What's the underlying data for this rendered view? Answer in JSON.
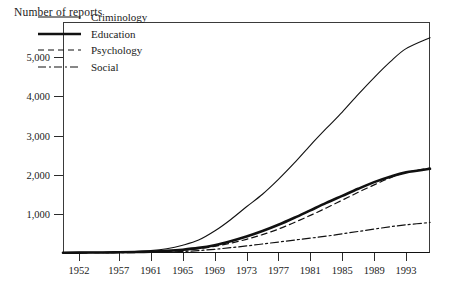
{
  "chart_data": {
    "type": "line",
    "title": "Number of reports",
    "ylabel": "Number of reports",
    "xlabel": "",
    "grid": false,
    "legend_position": "top-left-inside",
    "xlim": [
      1950,
      1996
    ],
    "ylim": [
      0,
      5900
    ],
    "ytick_labels": [
      "1,000",
      "2,000",
      "3,000",
      "4,000",
      "5,000"
    ],
    "ytick_values": [
      1000,
      2000,
      3000,
      4000,
      5000
    ],
    "xtick_labels": [
      "1952",
      "1957",
      "1961",
      "1965",
      "1969",
      "1973",
      "1977",
      "1981",
      "1985",
      "1989",
      "1993"
    ],
    "xtick_values": [
      1952,
      1957,
      1961,
      1965,
      1969,
      1973,
      1977,
      1981,
      1985,
      1989,
      1993
    ],
    "x": [
      1950,
      1952,
      1955,
      1957,
      1959,
      1961,
      1963,
      1965,
      1967,
      1969,
      1971,
      1973,
      1975,
      1977,
      1979,
      1981,
      1983,
      1985,
      1987,
      1989,
      1991,
      1993,
      1996
    ],
    "series": [
      {
        "name": "Criminology",
        "style": "solid-thin",
        "values": [
          10,
          15,
          20,
          28,
          40,
          60,
          110,
          200,
          330,
          560,
          850,
          1180,
          1500,
          1880,
          2300,
          2750,
          3180,
          3600,
          4050,
          4480,
          4880,
          5220,
          5500
        ]
      },
      {
        "name": "Education",
        "style": "solid-thick",
        "values": [
          8,
          10,
          14,
          18,
          24,
          35,
          55,
          85,
          130,
          200,
          300,
          420,
          560,
          720,
          900,
          1090,
          1280,
          1460,
          1640,
          1810,
          1950,
          2060,
          2150
        ]
      },
      {
        "name": "Psychology",
        "style": "dashed",
        "values": [
          6,
          8,
          11,
          14,
          19,
          28,
          44,
          70,
          110,
          170,
          250,
          350,
          470,
          610,
          780,
          960,
          1150,
          1350,
          1550,
          1740,
          1920,
          2060,
          2170
        ]
      },
      {
        "name": "Social",
        "style": "dash-dot",
        "values": [
          4,
          5,
          7,
          9,
          12,
          17,
          25,
          40,
          62,
          95,
          135,
          180,
          230,
          280,
          330,
          380,
          430,
          490,
          550,
          610,
          670,
          720,
          780
        ]
      }
    ]
  },
  "legend": {
    "items": [
      {
        "label": "Criminology",
        "style": "solid-thin"
      },
      {
        "label": "Education",
        "style": "solid-thick"
      },
      {
        "label": "Psychology",
        "style": "dashed"
      },
      {
        "label": "Social",
        "style": "dash-dot"
      }
    ]
  },
  "colors": {
    "line": "#111111",
    "axis": "#2b2b2b",
    "text": "#1b1b1b",
    "background": "#ffffff"
  }
}
